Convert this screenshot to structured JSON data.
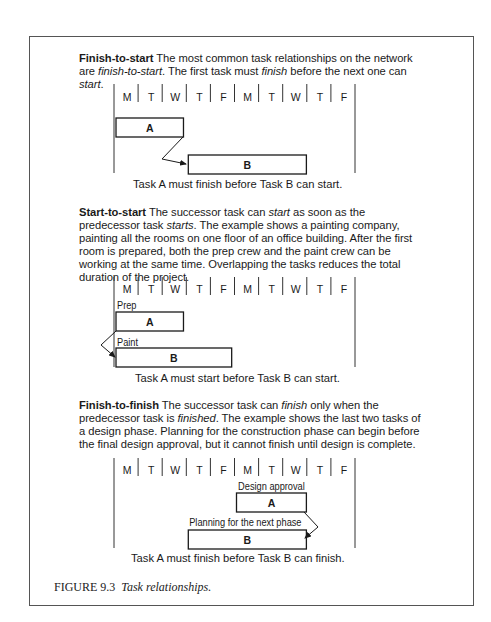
{
  "figure": {
    "number": "FIGURE 9.3",
    "title": "Task relationships."
  },
  "days": [
    "M",
    "T",
    "W",
    "T",
    "F",
    "M",
    "T",
    "W",
    "T",
    "F"
  ],
  "sections": [
    {
      "heading": "Finish-to-start",
      "text_parts": [
        {
          "t": " The most common task relationships on the network are ",
          "i": false
        },
        {
          "t": "finish-to-start",
          "i": true
        },
        {
          "t": ". The first task must ",
          "i": false
        },
        {
          "t": "finish",
          "i": true
        },
        {
          "t": " before the next one can ",
          "i": false
        },
        {
          "t": "start",
          "i": true
        },
        {
          "t": ".",
          "i": false
        }
      ],
      "caption": "Task A must finish before Task B can start.",
      "tasks": [
        {
          "label": "A",
          "above": "",
          "start_day": 0,
          "end_day": 2.8
        },
        {
          "label": "B",
          "above": "",
          "start_day": 3,
          "end_day": 7.9
        }
      ],
      "relationship": "finish-to-start"
    },
    {
      "heading": "Start-to-start",
      "text_parts": [
        {
          "t": " The successor task can ",
          "i": false
        },
        {
          "t": "start",
          "i": true
        },
        {
          "t": " as soon as the predecessor task ",
          "i": false
        },
        {
          "t": "starts",
          "i": true
        },
        {
          "t": ". The example shows a painting company, painting all the rooms on one floor of an office building. After the first room is prepared, both the prep crew and the paint crew can be working at the same time. Overlapping the tasks reduces the total duration of the project.",
          "i": false
        }
      ],
      "caption": "Task A must start before Task B can start.",
      "tasks": [
        {
          "label": "A",
          "above": "Prep",
          "start_day": 0,
          "end_day": 2.8
        },
        {
          "label": "B",
          "above": "Paint",
          "start_day": 0,
          "end_day": 4.8
        }
      ],
      "relationship": "start-to-start"
    },
    {
      "heading": "Finish-to-finish",
      "text_parts": [
        {
          "t": " The successor task can ",
          "i": false
        },
        {
          "t": "finish",
          "i": true
        },
        {
          "t": " only when the predecessor task is ",
          "i": false
        },
        {
          "t": "finished",
          "i": true
        },
        {
          "t": ". The example shows the last two tasks of a design phase. Planning for the construction phase can begin before the final design approval, but it cannot finish until design is complete.",
          "i": false
        }
      ],
      "caption": "Task A must finish before Task B can finish.",
      "tasks": [
        {
          "label": "A",
          "above": "Design approval",
          "start_day": 5,
          "end_day": 7.9
        },
        {
          "label": "B",
          "above": "Planning for the next phase",
          "start_day": 3,
          "end_day": 7.9
        }
      ],
      "relationship": "finish-to-finish"
    }
  ]
}
